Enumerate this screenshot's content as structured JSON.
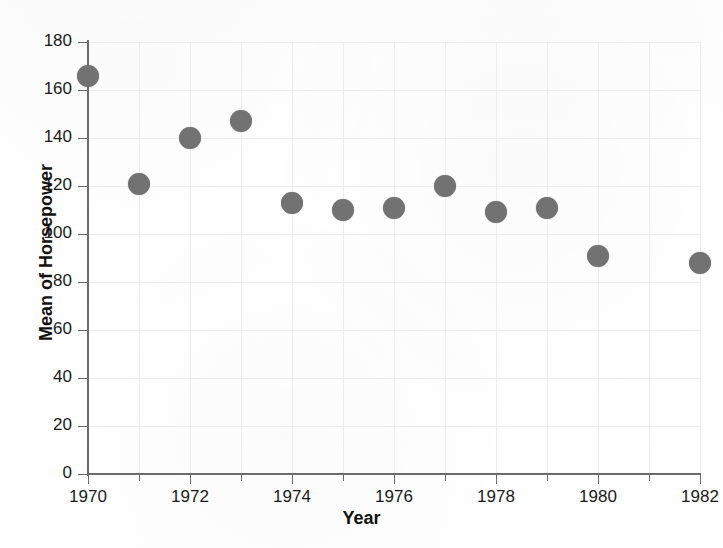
{
  "figure": {
    "cutoff_header_text": "",
    "dot_color": "#727272",
    "axis_color": "#6b6b6b",
    "grid_color": "#ededed"
  },
  "chart_data": {
    "type": "scatter",
    "title": "",
    "xlabel": "Year",
    "ylabel": "Mean of Horsepower",
    "xlim": [
      1969.7,
      1982.5
    ],
    "ylim": [
      0,
      180
    ],
    "grid": true,
    "legend": null,
    "y_ticks": [
      0,
      20,
      40,
      60,
      80,
      100,
      120,
      140,
      160,
      180
    ],
    "y_tick_labels": [
      "0",
      "20",
      "40",
      "60",
      "80",
      "100",
      "120",
      "140",
      "160",
      "180"
    ],
    "x_ticks": [
      1970,
      1971,
      1972,
      1973,
      1974,
      1975,
      1976,
      1977,
      1978,
      1979,
      1980,
      1981,
      1982
    ],
    "x_tick_labels_major": [
      "1970",
      "1972",
      "1974",
      "1976",
      "1978",
      "1980",
      "1982"
    ],
    "x_major_ticks": [
      1970,
      1972,
      1974,
      1976,
      1978,
      1980,
      1982
    ],
    "x": [
      1970,
      1971,
      1972,
      1973,
      1974,
      1975,
      1976,
      1977,
      1978,
      1979,
      1980,
      1982
    ],
    "y": [
      166,
      121,
      140,
      147,
      113,
      110,
      111,
      120,
      109,
      111,
      91,
      88
    ],
    "points": [
      {
        "year": 1970,
        "value": 166
      },
      {
        "year": 1971,
        "value": 121
      },
      {
        "year": 1972,
        "value": 140
      },
      {
        "year": 1973,
        "value": 147
      },
      {
        "year": 1974,
        "value": 113
      },
      {
        "year": 1975,
        "value": 110
      },
      {
        "year": 1976,
        "value": 111
      },
      {
        "year": 1977,
        "value": 120
      },
      {
        "year": 1978,
        "value": 109
      },
      {
        "year": 1979,
        "value": 111
      },
      {
        "year": 1980,
        "value": 91
      },
      {
        "year": 1982,
        "value": 88
      }
    ]
  }
}
